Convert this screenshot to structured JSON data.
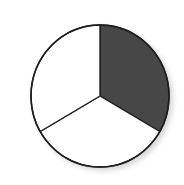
{
  "diagram": {
    "type": "fraction-circle",
    "parts_total": 3,
    "parts_shaded": 1,
    "fraction_shaded": "1/3",
    "colors": {
      "shaded": "#474747",
      "unshaded": "#ffffff",
      "outline": "#1e1e1e",
      "shadow": "#d8d8d8"
    },
    "geometry": {
      "cx": 100,
      "cy": 96,
      "rx": 69,
      "ry": 71
    },
    "sectors": [
      {
        "name": "top-right",
        "start_deg": -90,
        "end_deg": 30,
        "shaded": true
      },
      {
        "name": "bottom",
        "start_deg": 30,
        "end_deg": 150,
        "shaded": false
      },
      {
        "name": "top-left",
        "start_deg": 150,
        "end_deg": 270,
        "shaded": false
      }
    ]
  }
}
